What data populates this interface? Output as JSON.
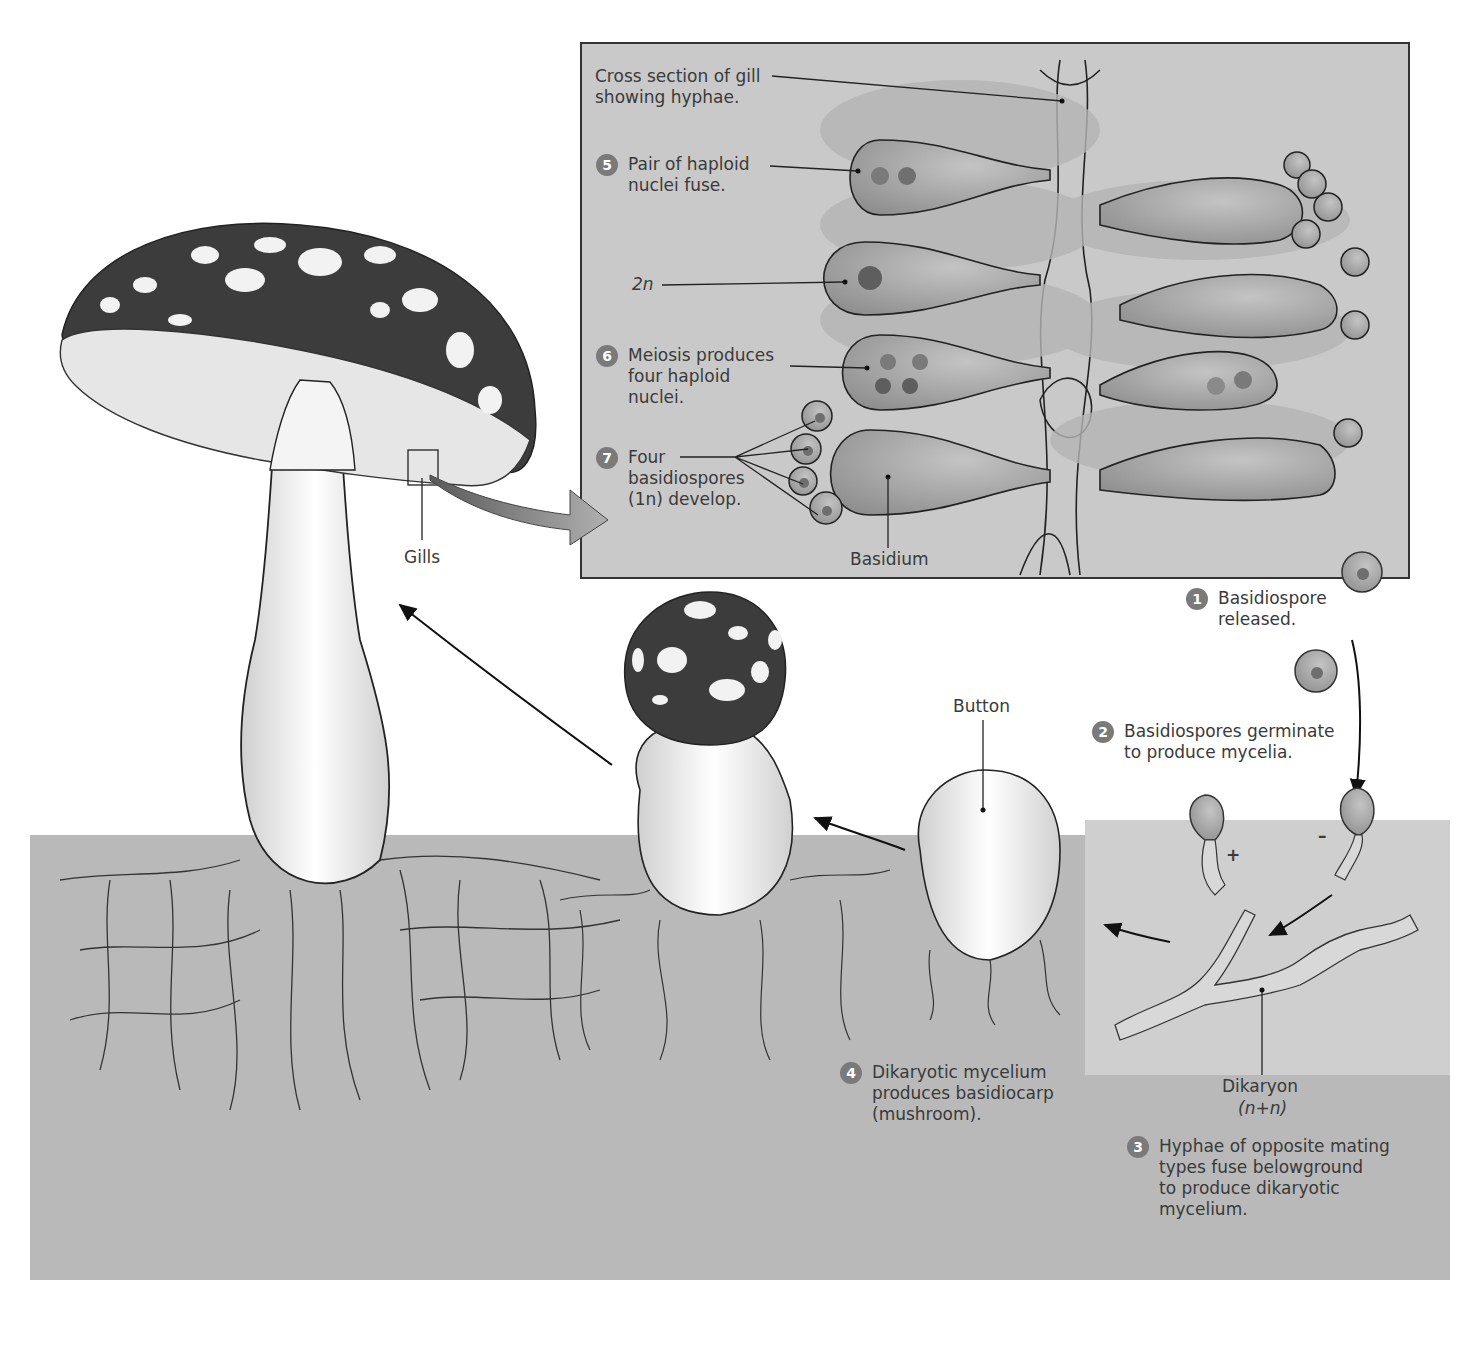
{
  "diagram": {
    "colors": {
      "soil": "#b9b9b9",
      "inset_bg": "#c9c9c9",
      "step_badge": "#7a7a7a",
      "cap_dark": "#3c3c3c",
      "cell_fill": "#9a9a9a",
      "nucleus": "#6e6e6e"
    },
    "inset": {
      "title": "Cross section of gill\nshowing hyphae.",
      "labels": {
        "two_n": "2n",
        "basidium": "Basidium"
      }
    },
    "structures": {
      "gills": "Gills",
      "button": "Button",
      "dikaryon": "Dikaryon",
      "dikaryon_ploidy": "(n+n)",
      "plus": "+",
      "minus": "–"
    },
    "steps": [
      {
        "num": "1",
        "text": "Basidiospore\nreleased."
      },
      {
        "num": "2",
        "text": "Basidiospores germinate\nto produce mycelia."
      },
      {
        "num": "3",
        "text": "Hyphae of opposite mating\ntypes fuse belowground\nto produce dikaryotic\nmycelium."
      },
      {
        "num": "4",
        "text": "Dikaryotic mycelium\nproduces basidiocarp\n(mushroom)."
      },
      {
        "num": "5",
        "text": "Pair of haploid\nnuclei fuse."
      },
      {
        "num": "6",
        "text": "Meiosis produces\nfour haploid\nnuclei."
      },
      {
        "num": "7",
        "text": "Four\nbasidiospores\n(1n) develop."
      }
    ]
  }
}
